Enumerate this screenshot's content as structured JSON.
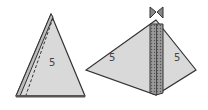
{
  "figure": {
    "left_piece": {
      "label": "5",
      "fill": "#d9d9d9",
      "stroke": "#333333"
    },
    "right_piece": {
      "left_label": "5",
      "right_label": "5",
      "fill": "#d9d9d9",
      "stroke": "#333333",
      "strip_fill": "#8a8a8a"
    },
    "bow_icon": "bow-tie-icon"
  }
}
